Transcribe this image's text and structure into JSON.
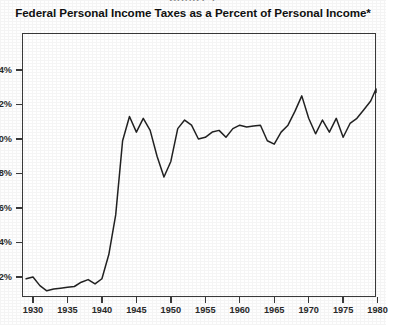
{
  "header": {
    "chart_number": "CHART 1",
    "title": "Federal Personal Income Taxes as a Percent of Personal Income*"
  },
  "chart_data": {
    "type": "line",
    "title": "Federal Personal Income Taxes as a Percent of Personal Income*",
    "xlabel": "",
    "ylabel": "",
    "grid": false,
    "legend": "none",
    "xlim": [
      1929,
      1981.5
    ],
    "ylim": [
      0.6,
      14.9
    ],
    "y_tick_labels": [
      "14%",
      "12%",
      "10%",
      "8%",
      "6%",
      "4%",
      "2%"
    ],
    "y_tick_values": [
      14,
      12,
      10,
      8,
      6,
      4,
      2
    ],
    "x_tick_labels": [
      "1930",
      "1935",
      "1940",
      "1945",
      "1950",
      "1955",
      "1960",
      "1965",
      "1970",
      "1975",
      "1980"
    ],
    "x_tick_values": [
      1930,
      1935,
      1940,
      1945,
      1950,
      1955,
      1960,
      1965,
      1970,
      1975,
      1980
    ],
    "series": [
      {
        "name": "Federal personal income taxes as percent of personal income",
        "x": [
          1929,
          1930,
          1931,
          1932,
          1933,
          1934,
          1935,
          1936,
          1937,
          1938,
          1939,
          1940,
          1941,
          1942,
          1943,
          1944,
          1945,
          1946,
          1947,
          1948,
          1949,
          1950,
          1951,
          1952,
          1953,
          1954,
          1955,
          1956,
          1957,
          1958,
          1959,
          1960,
          1961,
          1962,
          1963,
          1964,
          1965,
          1966,
          1967,
          1968,
          1969,
          1970,
          1971,
          1972,
          1973,
          1974,
          1975,
          1976,
          1977,
          1978,
          1979,
          1980,
          1981
        ],
        "values": [
          1.9,
          2.0,
          1.5,
          1.2,
          1.3,
          1.35,
          1.4,
          1.45,
          1.7,
          1.85,
          1.6,
          1.9,
          3.3,
          5.6,
          9.9,
          11.3,
          10.4,
          11.2,
          10.5,
          9.0,
          7.8,
          8.7,
          10.6,
          11.1,
          10.8,
          10.0,
          10.1,
          10.4,
          10.5,
          10.1,
          10.6,
          10.8,
          10.7,
          10.75,
          10.8,
          9.9,
          9.7,
          10.4,
          10.8,
          11.6,
          12.5,
          11.2,
          10.3,
          11.1,
          10.4,
          11.2,
          10.1,
          10.9,
          11.2,
          11.7,
          12.2,
          12.9,
          12.7
        ]
      }
    ]
  }
}
